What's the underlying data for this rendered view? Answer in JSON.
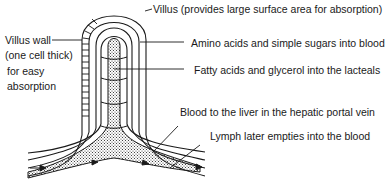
{
  "diagram": {
    "labels": {
      "villus": "Villus (provides large surface area for absorption)",
      "villus_wall_1": "Villus wall",
      "villus_wall_2": "(one cell thick)",
      "villus_wall_3": "for easy",
      "villus_wall_4": "absorption",
      "amino": "Amino acids and simple sugars into blood",
      "fatty": "Fatty acids and glycerol into the lacteals",
      "blood": "Blood to the liver in the hepatic portal vein",
      "lymph": "Lymph later empties into the blood"
    },
    "colors": {
      "line": "#1a1a1a",
      "background": "#ffffff",
      "stipple": "#333333"
    }
  }
}
